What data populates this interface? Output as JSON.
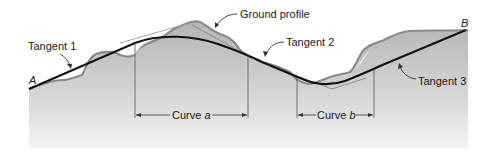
{
  "diagram": {
    "endpoints": {
      "start": "A",
      "end": "B"
    },
    "labels": {
      "ground_profile": "Ground profile",
      "tangent_1": "Tangent 1",
      "tangent_2": "Tangent 2",
      "tangent_3": "Tangent 3"
    },
    "curves": [
      {
        "prefix": "Curve ",
        "name": "a"
      },
      {
        "prefix": "Curve ",
        "name": "b"
      }
    ],
    "colors": {
      "ground_fill": "#b8b8b8",
      "ground_edge": "#8a8a8a",
      "road_line": "#111111",
      "tangent_extension": "#9a9a9a",
      "text": "#1a1a1a"
    }
  }
}
